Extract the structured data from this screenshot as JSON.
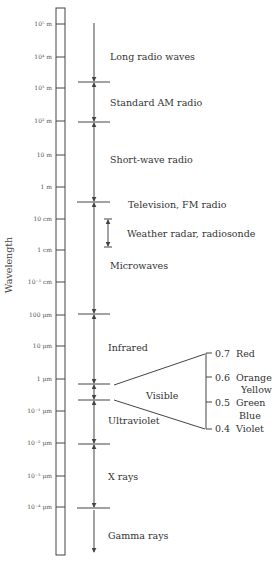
{
  "axis": {
    "title": "Wavelength",
    "ticks": [
      {
        "label": "10⁵ m",
        "y": 24
      },
      {
        "label": "10⁴ m",
        "y": 57
      },
      {
        "label": "10³ m",
        "y": 88
      },
      {
        "label": "10² m",
        "y": 121
      },
      {
        "label": "10 m",
        "y": 155
      },
      {
        "label": "1 m",
        "y": 187
      },
      {
        "label": "10 cm",
        "y": 219
      },
      {
        "label": "1 cm",
        "y": 250
      },
      {
        "label": "10⁻¹ cm",
        "y": 282
      },
      {
        "label": "100 μm",
        "y": 315
      },
      {
        "label": "10 μm",
        "y": 346
      },
      {
        "label": "1 μm",
        "y": 379
      },
      {
        "label": "10⁻¹ μm",
        "y": 411
      },
      {
        "label": "10⁻² μm",
        "y": 443
      },
      {
        "label": "10⁻³ μm",
        "y": 476
      },
      {
        "label": "10⁻⁴ μm",
        "y": 507
      }
    ]
  },
  "bands": [
    {
      "label": "Long radio waves",
      "y_label": 57
    },
    {
      "label": "Standard AM radio",
      "y_label": 103
    },
    {
      "label": "Short-wave radio",
      "y_label": 160
    },
    {
      "label": "Television, FM radio",
      "y_label": 205
    },
    {
      "label": "Weather radar, radiosonde",
      "y_label": 234
    },
    {
      "label": "Microwaves",
      "y_label": 266
    },
    {
      "label": "Infrared",
      "y_label": 350
    },
    {
      "label": "Visible",
      "y_label": 398
    },
    {
      "label": "Ultraviolet",
      "y_label": 423
    },
    {
      "label": "X rays",
      "y_label": 479
    },
    {
      "label": "Gamma rays",
      "y_label": 538
    }
  ],
  "visible_spectrum": [
    {
      "value": "0.7",
      "color": "Red"
    },
    {
      "value": "0.6",
      "color": "Orange"
    },
    {
      "value": "",
      "color": "Yellow"
    },
    {
      "value": "0.5",
      "color": "Green"
    },
    {
      "value": "",
      "color": "Blue"
    },
    {
      "value": "0.4",
      "color": "Violet"
    }
  ]
}
